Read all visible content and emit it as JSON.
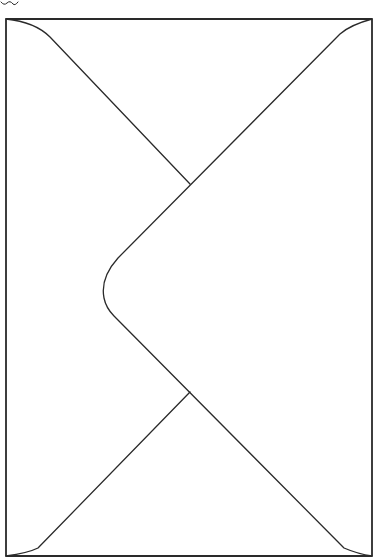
{
  "drawing": {
    "subject": "envelope-back",
    "style": "hand-drawn line art",
    "colors": {
      "background": "#ffffff",
      "ink": "#2a2a2a"
    },
    "border": {
      "x": 6,
      "y": 19,
      "width": 366,
      "height": 537
    },
    "flap_tip": {
      "x": 104,
      "y": 284
    },
    "crossings": [
      {
        "x": 190,
        "y": 184
      },
      {
        "x": 190,
        "y": 392
      }
    ]
  }
}
